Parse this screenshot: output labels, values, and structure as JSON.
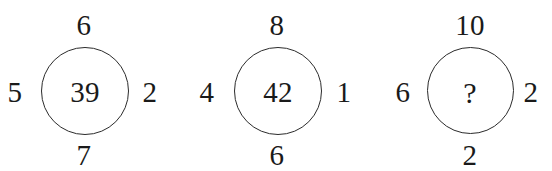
{
  "canvas": {
    "width": 552,
    "height": 171,
    "background_color": "#ffffff",
    "stroke_color": "#2b2b2b",
    "text_color": "#1a1a1a"
  },
  "puzzle": {
    "type": "number-circle-sequence",
    "groups": [
      {
        "id": "group-1",
        "top": "6",
        "left": "5",
        "center": "39",
        "right": "2",
        "bottom": "7"
      },
      {
        "id": "group-2",
        "top": "8",
        "left": "4",
        "center": "42",
        "right": "1",
        "bottom": "6"
      },
      {
        "id": "group-3",
        "top": "10",
        "left": "6",
        "center": "?",
        "right": "2",
        "bottom": "2"
      }
    ]
  }
}
